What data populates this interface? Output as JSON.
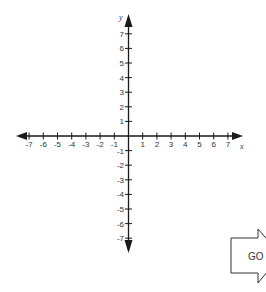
{
  "graph": {
    "x_axis_label": "x",
    "y_axis_label": "y",
    "x_ticks": [
      -7,
      -6,
      -5,
      -4,
      -3,
      -2,
      -1,
      1,
      2,
      3,
      4,
      5,
      6,
      7
    ],
    "y_ticks": [
      7,
      6,
      5,
      4,
      3,
      2,
      1,
      -1,
      -2,
      -3,
      -4,
      -5,
      -6,
      -7
    ],
    "colors": {
      "axis": "#1a1a1a",
      "label": "#333333"
    }
  },
  "go_button": {
    "label": "GO"
  }
}
